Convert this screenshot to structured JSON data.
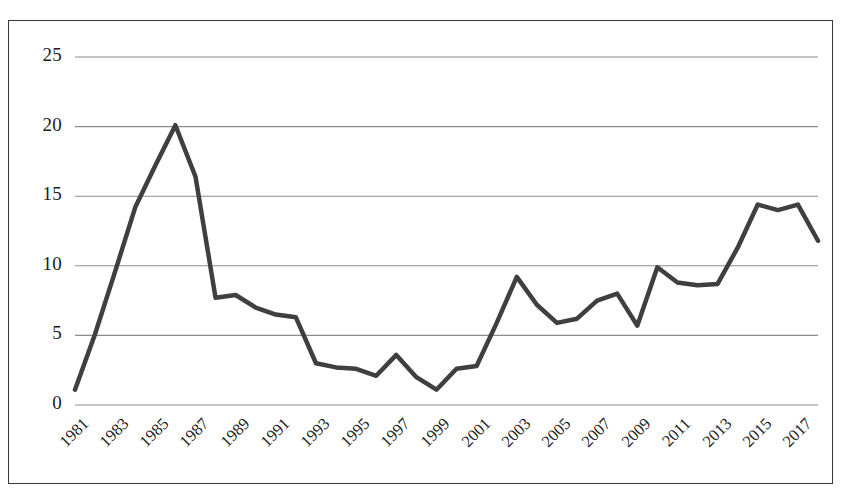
{
  "chart_data": {
    "type": "line",
    "title": "",
    "subtitle": "",
    "xlabel": "",
    "ylabel": "",
    "legend": [],
    "legend_position": "none",
    "grid": true,
    "grid_axis": "y",
    "xlim": [
      1981,
      2018
    ],
    "ylim": [
      0,
      25
    ],
    "y_ticks": [
      0,
      5,
      10,
      15,
      20,
      25
    ],
    "y_tick_labels": [
      "0",
      "5",
      "10",
      "15",
      "20",
      "25"
    ],
    "x_tick_labels": [
      "1981",
      "1983",
      "1985",
      "1987",
      "1989",
      "1991",
      "1993",
      "1995",
      "1997",
      "1999",
      "2001",
      "2003",
      "2005",
      "2007",
      "2009",
      "2011",
      "2013",
      "2015",
      "2017"
    ],
    "x_tick_values": [
      1981,
      1983,
      1985,
      1987,
      1989,
      1991,
      1993,
      1995,
      1997,
      1999,
      2001,
      2003,
      2005,
      2007,
      2009,
      2011,
      2013,
      2015,
      2017
    ],
    "x_tick_rotation": -45,
    "series": [
      {
        "name": "series-1",
        "color": "#3f3f3f",
        "line_width": 4.5,
        "x": [
          1981,
          1982,
          1983,
          1984,
          1985,
          1986,
          1987,
          1988,
          1989,
          1990,
          1991,
          1992,
          1993,
          1994,
          1995,
          1996,
          1997,
          1998,
          1999,
          2000,
          2001,
          2002,
          2003,
          2004,
          2005,
          2006,
          2007,
          2008,
          2009,
          2010,
          2011,
          2012,
          2013,
          2014,
          2015,
          2016,
          2017,
          2018
        ],
        "values": [
          1.1,
          5.1,
          9.6,
          14.2,
          17.2,
          20.1,
          16.4,
          7.7,
          7.9,
          7.0,
          6.5,
          6.3,
          3.0,
          2.7,
          2.6,
          2.1,
          3.6,
          2.0,
          1.1,
          2.6,
          2.8,
          5.9,
          9.2,
          7.2,
          5.9,
          6.2,
          7.5,
          8.0,
          5.7,
          9.9,
          8.8,
          8.6,
          8.7,
          11.3,
          14.4,
          14.0,
          14.4,
          11.8
        ]
      }
    ]
  },
  "figure": {
    "background_color": "#ffffff",
    "border_color": "#3a3a3a",
    "gridline_color": "#8c8c8c",
    "text_color": "#1c1c1c"
  }
}
